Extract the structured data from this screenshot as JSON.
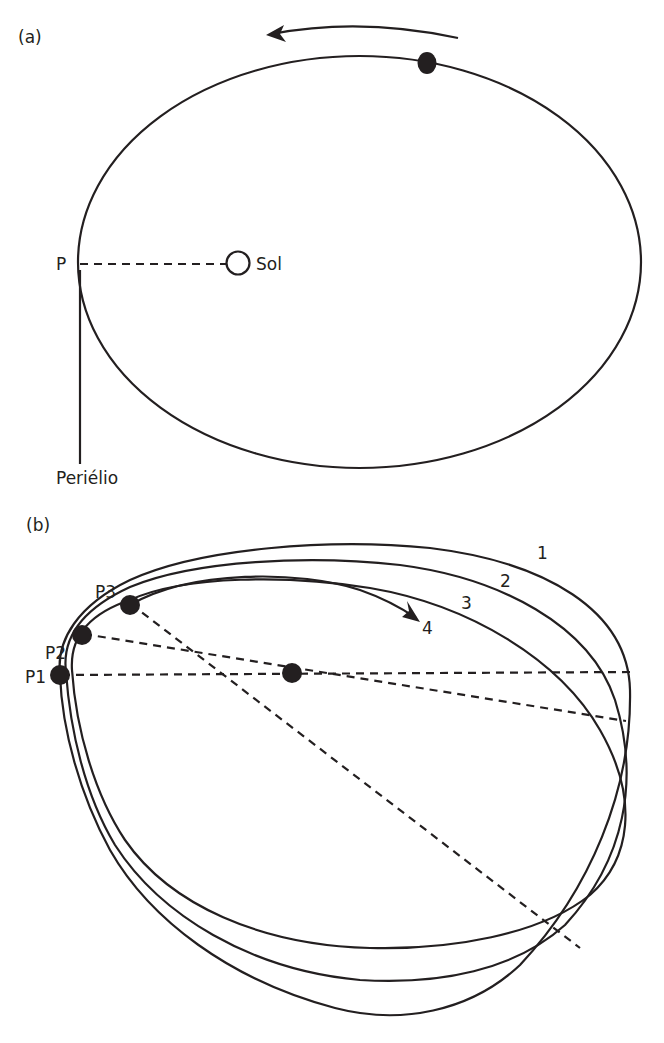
{
  "panel_a": {
    "label": "(a)",
    "perihelion_point_label": "P",
    "sun_label": "Sol",
    "perihelion_label": "Periélio",
    "motion_direction": "counterclockwise"
  },
  "panel_b": {
    "label": "(b)",
    "perihelion_labels": [
      "P1",
      "P2",
      "P3"
    ],
    "orbit_labels": [
      "1",
      "2",
      "3",
      "4"
    ]
  },
  "colors": {
    "ink": "#231f20",
    "background": "#ffffff"
  }
}
